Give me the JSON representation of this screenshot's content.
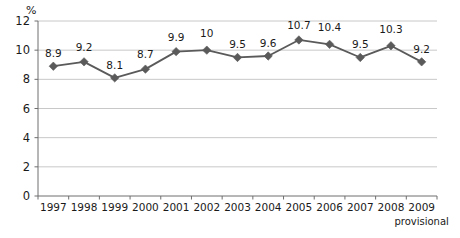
{
  "chart_data": {
    "type": "line",
    "title": "",
    "xlabel": "",
    "ylabel": "%",
    "ylim": [
      0,
      12
    ],
    "yticks": [
      0,
      2,
      4,
      6,
      8,
      10,
      12
    ],
    "grid": true,
    "legend": null,
    "categories": [
      "1997",
      "1998",
      "1999",
      "2000",
      "2001",
      "2002",
      "2003",
      "2004",
      "2005",
      "2006",
      "2007",
      "2008",
      "2009"
    ],
    "values": [
      8.9,
      9.2,
      8.1,
      8.7,
      9.9,
      10,
      9.5,
      9.6,
      10.7,
      10.4,
      9.5,
      10.3,
      9.2
    ],
    "point_labels": [
      "8.9",
      "9.2",
      "8.1",
      "8.7",
      "9.9",
      "10",
      "9.5",
      "9.6",
      "10.7",
      "10.4",
      "9.5",
      "10.3",
      "9.2"
    ],
    "annotations": [
      {
        "text": "provisional",
        "attached_to": "2009"
      }
    ],
    "series_color": "#5a5a5a",
    "marker": "diamond",
    "grid_color": "#c8c8c8",
    "axis_color": "#6e6e6e"
  },
  "axis": {
    "unit_label": "%",
    "ytick_labels": [
      "12",
      "10",
      "8",
      "6",
      "4",
      "2",
      "0"
    ]
  }
}
